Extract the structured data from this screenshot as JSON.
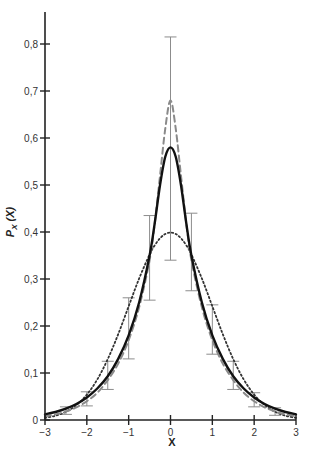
{
  "chart_data": {
    "type": "line",
    "title": "",
    "xlabel": "X",
    "ylabel": "P_X (X)",
    "ylabel_main": "P",
    "ylabel_sub": "X",
    "ylabel_arg": " (X)",
    "xlim": [
      -3,
      3
    ],
    "ylim": [
      0,
      0.86
    ],
    "grid": false,
    "legend": null,
    "x_ticks": [
      -3,
      -2,
      -1,
      0,
      1,
      2,
      3
    ],
    "x_tick_labels": [
      "−3",
      "−2",
      "−1",
      "0",
      "1",
      "2",
      "3"
    ],
    "y_ticks": [
      0,
      0.1,
      0.2,
      0.3,
      0.4,
      0.5,
      0.6,
      0.7,
      0.8
    ],
    "y_tick_labels": [
      "0",
      "0,1",
      "0,2",
      "0,3",
      "0,4",
      "0,5",
      "0,6",
      "0,7",
      "0,8"
    ],
    "x": [
      -3,
      -2.75,
      -2.5,
      -2.25,
      -2,
      -1.75,
      -1.5,
      -1.25,
      -1,
      -0.75,
      -0.5,
      -0.375,
      -0.25,
      -0.125,
      0,
      0.125,
      0.25,
      0.375,
      0.5,
      0.75,
      1,
      1.25,
      1.5,
      1.75,
      2,
      2.25,
      2.5,
      2.75,
      3
    ],
    "series": [
      {
        "name": "solid",
        "style": "solid",
        "color": "#111111",
        "values": [
          0.012,
          0.017,
          0.024,
          0.034,
          0.048,
          0.067,
          0.093,
          0.13,
          0.18,
          0.25,
          0.35,
          0.42,
          0.5,
          0.56,
          0.58,
          0.56,
          0.5,
          0.42,
          0.35,
          0.25,
          0.18,
          0.13,
          0.093,
          0.067,
          0.048,
          0.034,
          0.024,
          0.017,
          0.012
        ]
      },
      {
        "name": "dashed",
        "style": "dashed",
        "color": "#888888",
        "values": [
          0.008,
          0.012,
          0.018,
          0.027,
          0.04,
          0.058,
          0.085,
          0.12,
          0.17,
          0.24,
          0.34,
          0.42,
          0.52,
          0.62,
          0.68,
          0.62,
          0.52,
          0.42,
          0.34,
          0.24,
          0.17,
          0.12,
          0.085,
          0.058,
          0.04,
          0.027,
          0.018,
          0.012,
          0.008
        ]
      },
      {
        "name": "dotted",
        "style": "dotted",
        "color": "#333333",
        "values": [
          0.0044,
          0.0091,
          0.0175,
          0.0317,
          0.054,
          0.0863,
          0.1295,
          0.1826,
          0.242,
          0.3011,
          0.3521,
          0.3719,
          0.3867,
          0.3958,
          0.3989,
          0.3958,
          0.3867,
          0.3719,
          0.3521,
          0.3011,
          0.242,
          0.1826,
          0.1295,
          0.0863,
          0.054,
          0.0317,
          0.0175,
          0.0091,
          0.0044
        ]
      }
    ],
    "error_bars": [
      {
        "x": -2.5,
        "low": 0.012,
        "high": 0.028
      },
      {
        "x": -2.0,
        "low": 0.03,
        "high": 0.06
      },
      {
        "x": -1.5,
        "low": 0.065,
        "high": 0.125
      },
      {
        "x": -1.0,
        "low": 0.13,
        "high": 0.26
      },
      {
        "x": -0.5,
        "low": 0.255,
        "high": 0.435
      },
      {
        "x": 0.0,
        "low": 0.34,
        "high": 0.815
      },
      {
        "x": 0.5,
        "low": 0.275,
        "high": 0.44
      },
      {
        "x": 1.0,
        "low": 0.14,
        "high": 0.245
      },
      {
        "x": 1.5,
        "low": 0.065,
        "high": 0.125
      },
      {
        "x": 2.0,
        "low": 0.028,
        "high": 0.058
      },
      {
        "x": 2.5,
        "low": 0.01,
        "high": 0.026
      }
    ]
  }
}
